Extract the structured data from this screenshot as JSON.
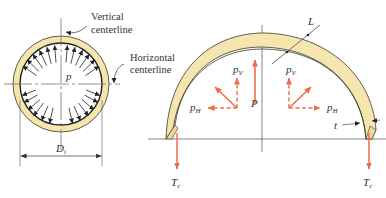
{
  "figure": {
    "left_view": {
      "labels": {
        "vertical_centerline_line1": "Vertical",
        "vertical_centerline_line2": "centerline",
        "horizontal_centerline_line1": "Horizontal",
        "horizontal_centerline_line2": "centerline",
        "pressure": "p",
        "diameter": "D",
        "diameter_sub": "i"
      }
    },
    "right_view": {
      "labels": {
        "length": "L",
        "thickness": "t",
        "total_force": "P",
        "pv_left": "p",
        "pv_left_sub": "V",
        "pv_right": "p",
        "pv_right_sub": "V",
        "ph_left": "p",
        "ph_left_sub": "H",
        "ph_right": "p",
        "ph_right_sub": "H",
        "tc_left": "T",
        "tc_left_sub": "c",
        "tc_right": "T",
        "tc_right_sub": "c"
      }
    },
    "colors": {
      "shell_fill": "#f5e6b0",
      "shell_stroke": "#3a3a2a",
      "force_arrow": "#ef6c4a",
      "line": "#555555",
      "pressure_arrow": "#222222"
    }
  }
}
